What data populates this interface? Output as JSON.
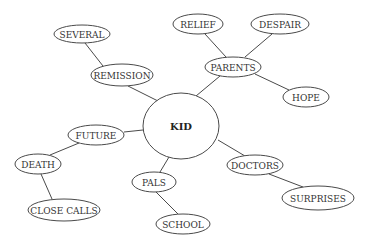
{
  "diagram": {
    "type": "mind-map",
    "center": {
      "id": "kid",
      "label": "KID",
      "x": 181,
      "y": 126,
      "rx": 38,
      "ry": 33
    },
    "nodes": [
      {
        "id": "several",
        "label": "SEVERAL",
        "x": 82,
        "y": 34,
        "rx": 28,
        "ry": 9
      },
      {
        "id": "remission",
        "label": "REMISSION",
        "x": 122,
        "y": 75,
        "rx": 31,
        "ry": 11
      },
      {
        "id": "relief",
        "label": "RELIEF",
        "x": 198,
        "y": 24,
        "rx": 25,
        "ry": 10
      },
      {
        "id": "despair",
        "label": "DESPAIR",
        "x": 280,
        "y": 24,
        "rx": 29,
        "ry": 10
      },
      {
        "id": "parents",
        "label": "PARENTS",
        "x": 233,
        "y": 67,
        "rx": 28,
        "ry": 10
      },
      {
        "id": "hope",
        "label": "HOPE",
        "x": 306,
        "y": 97,
        "rx": 23,
        "ry": 10
      },
      {
        "id": "future",
        "label": "FUTURE",
        "x": 96,
        "y": 135,
        "rx": 28,
        "ry": 10
      },
      {
        "id": "death",
        "label": "DEATH",
        "x": 38,
        "y": 164,
        "rx": 23,
        "ry": 10
      },
      {
        "id": "close-calls",
        "label": "CLOSE CALLS",
        "x": 64,
        "y": 210,
        "rx": 36,
        "ry": 11
      },
      {
        "id": "pals",
        "label": "PALS",
        "x": 154,
        "y": 182,
        "rx": 22,
        "ry": 10
      },
      {
        "id": "school",
        "label": "SCHOOL",
        "x": 183,
        "y": 224,
        "rx": 27,
        "ry": 10
      },
      {
        "id": "doctors",
        "label": "DOCTORS",
        "x": 255,
        "y": 165,
        "rx": 28,
        "ry": 10
      },
      {
        "id": "surprises",
        "label": "SURPRISES",
        "x": 318,
        "y": 198,
        "rx": 36,
        "ry": 12
      }
    ],
    "edges": [
      {
        "from": "kid",
        "to": "remission",
        "x1": 158,
        "y1": 101,
        "x2": 128,
        "y2": 86
      },
      {
        "from": "remission",
        "to": "several",
        "x1": 103,
        "y1": 66,
        "x2": 85,
        "y2": 43
      },
      {
        "from": "kid",
        "to": "parents",
        "x1": 196,
        "y1": 96,
        "x2": 220,
        "y2": 76
      },
      {
        "from": "parents",
        "to": "relief",
        "x1": 226,
        "y1": 57,
        "x2": 205,
        "y2": 34
      },
      {
        "from": "parents",
        "to": "despair",
        "x1": 245,
        "y1": 57,
        "x2": 272,
        "y2": 34
      },
      {
        "from": "parents",
        "to": "hope",
        "x1": 255,
        "y1": 74,
        "x2": 289,
        "y2": 90
      },
      {
        "from": "kid",
        "to": "future",
        "x1": 143,
        "y1": 130,
        "x2": 124,
        "y2": 132
      },
      {
        "from": "future",
        "to": "death",
        "x1": 79,
        "y1": 143,
        "x2": 50,
        "y2": 155
      },
      {
        "from": "death",
        "to": "close-calls",
        "x1": 41,
        "y1": 174,
        "x2": 52,
        "y2": 199
      },
      {
        "from": "kid",
        "to": "pals",
        "x1": 169,
        "y1": 157,
        "x2": 160,
        "y2": 172
      },
      {
        "from": "pals",
        "to": "school",
        "x1": 156,
        "y1": 192,
        "x2": 178,
        "y2": 214
      },
      {
        "from": "kid",
        "to": "doctors",
        "x1": 218,
        "y1": 140,
        "x2": 245,
        "y2": 156
      },
      {
        "from": "doctors",
        "to": "surprises",
        "x1": 269,
        "y1": 174,
        "x2": 303,
        "y2": 187
      }
    ]
  }
}
